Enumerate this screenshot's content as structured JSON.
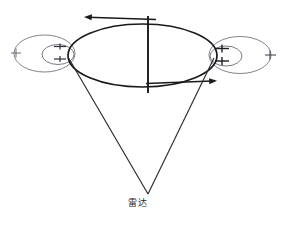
{
  "figure": {
    "title_caption": "雷达",
    "background_color": "#ffffff",
    "width": 287,
    "height": 225,
    "stroke_dark": "#1a1a1a",
    "stroke_light": "#6e6e78",
    "stroke_mid": "#3a3a3a"
  },
  "labels": {
    "radar": "雷达"
  },
  "geometry": {
    "main_ellipse": {
      "cx": 142.5,
      "cy": 55.5,
      "rx": 74.5,
      "ry": 31.5
    },
    "left_group": {
      "outer": {
        "cx": 44.5,
        "cy": 53.5,
        "rx": 30.5,
        "ry": 18.5
      },
      "inner": {
        "cx": 58.0,
        "cy": 54.5,
        "rx": 16.0,
        "ry": 10.0
      },
      "vertex_tick": {
        "x": 16,
        "y": 53
      },
      "inner_tick_1": {
        "x": 60,
        "y": 47
      },
      "inner_tick_2": {
        "x": 60,
        "y": 59
      }
    },
    "right_group": {
      "outer": {
        "cx": 240.0,
        "cy": 55.0,
        "rx": 31.0,
        "ry": 18.5
      },
      "inner": {
        "cx": 226.0,
        "cy": 56.0,
        "rx": 16.0,
        "ry": 10.0
      },
      "vertex_tick": {
        "x": 270,
        "y": 55
      },
      "inner_tick_1": {
        "x": 222,
        "y": 49
      },
      "inner_tick_2": {
        "x": 222,
        "y": 61
      }
    },
    "center_axis": {
      "x": 148,
      "y1": 16,
      "y2": 93
    },
    "arrow_top": {
      "x1": 155,
      "y1": 19,
      "x2": 84,
      "y2": 17,
      "direction": "left"
    },
    "arrow_bottom": {
      "x1": 146,
      "y1": 83,
      "x2": 216,
      "y2": 80,
      "direction": "right"
    },
    "radar_apex": {
      "x": 148,
      "y": 194
    },
    "radar_beam_left": {
      "x": 68,
      "y": 57
    },
    "radar_beam_right": {
      "x": 214,
      "y": 58
    }
  }
}
